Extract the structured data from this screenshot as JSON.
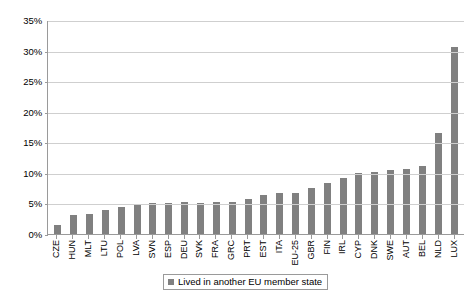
{
  "chart_data": {
    "type": "bar",
    "title": "",
    "subtitle": "",
    "xlabel": "",
    "ylabel": "",
    "ylim": [
      0,
      35
    ],
    "ytick_labels": [
      "35%",
      "30%",
      "25%",
      "20%",
      "15%",
      "10%",
      "5%",
      "0%"
    ],
    "ytick_values": [
      35,
      30,
      25,
      20,
      15,
      10,
      5,
      0
    ],
    "grid": true,
    "legend_position": "bottom",
    "legend": [
      "Lived in another EU member state"
    ],
    "series_name": "Lived in another EU member state",
    "bar_color": "#808080",
    "categories": [
      "CZE",
      "HUN",
      "MLT",
      "LTU",
      "POL",
      "LVA",
      "SVN",
      "ESP",
      "DEU",
      "SVK",
      "FRA",
      "GRC",
      "PRT",
      "EST",
      "ITA",
      "EU-25",
      "GBR",
      "FIN",
      "IRL",
      "CYP",
      "DNK",
      "SWE",
      "AUT",
      "BEL",
      "NLD",
      "LUX"
    ],
    "values": [
      1.5,
      3.1,
      3.3,
      4.0,
      4.4,
      4.8,
      5.0,
      5.1,
      5.2,
      5.1,
      5.2,
      5.3,
      5.7,
      6.4,
      6.7,
      6.7,
      7.6,
      8.4,
      9.1,
      9.9,
      10.1,
      10.4,
      10.6,
      11.2,
      16.5,
      30.6
    ]
  },
  "legend": {
    "entry_label": "Lived in another EU member state",
    "swatch_color": "#808080"
  }
}
